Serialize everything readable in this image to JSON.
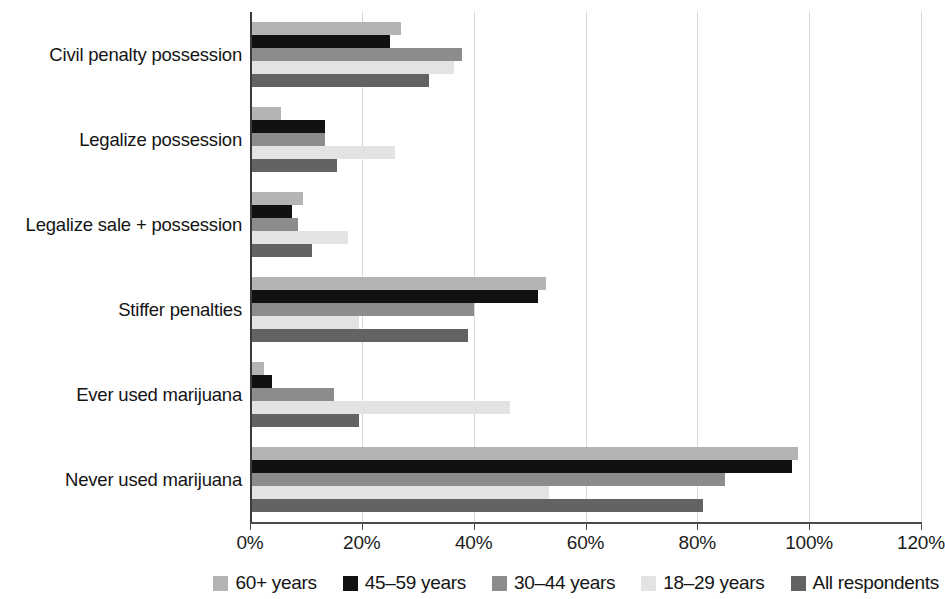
{
  "chart_data": {
    "type": "bar",
    "orientation": "horizontal",
    "title": "",
    "xlabel": "",
    "ylabel": "",
    "xlim": [
      0,
      120
    ],
    "xticks": [
      0,
      20,
      40,
      60,
      80,
      100,
      120
    ],
    "xtick_labels": [
      "0%",
      "20%",
      "40%",
      "60%",
      "80%",
      "100%",
      "120%"
    ],
    "grid": true,
    "grid_axis": "x",
    "legend_position": "bottom-right",
    "categories": [
      "Civil penalty possession",
      "Legalize possession",
      "Legalize sale + possession",
      "Stiffer penalties",
      "Ever used marijuana",
      "Never used marijuana"
    ],
    "series": [
      {
        "name": "60+ years",
        "color": "#b4b4b4",
        "values": [
          27,
          5.5,
          9.5,
          53,
          2.5,
          98
        ]
      },
      {
        "name": "45–59 years",
        "color": "#111111",
        "values": [
          25,
          13.5,
          7.5,
          51.5,
          4,
          97
        ]
      },
      {
        "name": "30–44 years",
        "color": "#8c8c8c",
        "values": [
          38,
          13.5,
          8.5,
          40,
          15,
          85
        ]
      },
      {
        "name": "18–29 years",
        "color": "#e3e3e3",
        "values": [
          36.5,
          26,
          17.5,
          19.5,
          46.5,
          53.5
        ]
      },
      {
        "name": "All respondents",
        "color": "#636363",
        "values": [
          32,
          15.5,
          11,
          39,
          19.5,
          81
        ]
      }
    ]
  },
  "legend": {
    "items": [
      {
        "label": "60+ years",
        "color": "#b4b4b4"
      },
      {
        "label": "45–59 years",
        "color": "#111111"
      },
      {
        "label": "30–44 years",
        "color": "#8c8c8c"
      },
      {
        "label": "18–29 years",
        "color": "#e3e3e3"
      },
      {
        "label": "All respondents",
        "color": "#636363"
      }
    ]
  }
}
